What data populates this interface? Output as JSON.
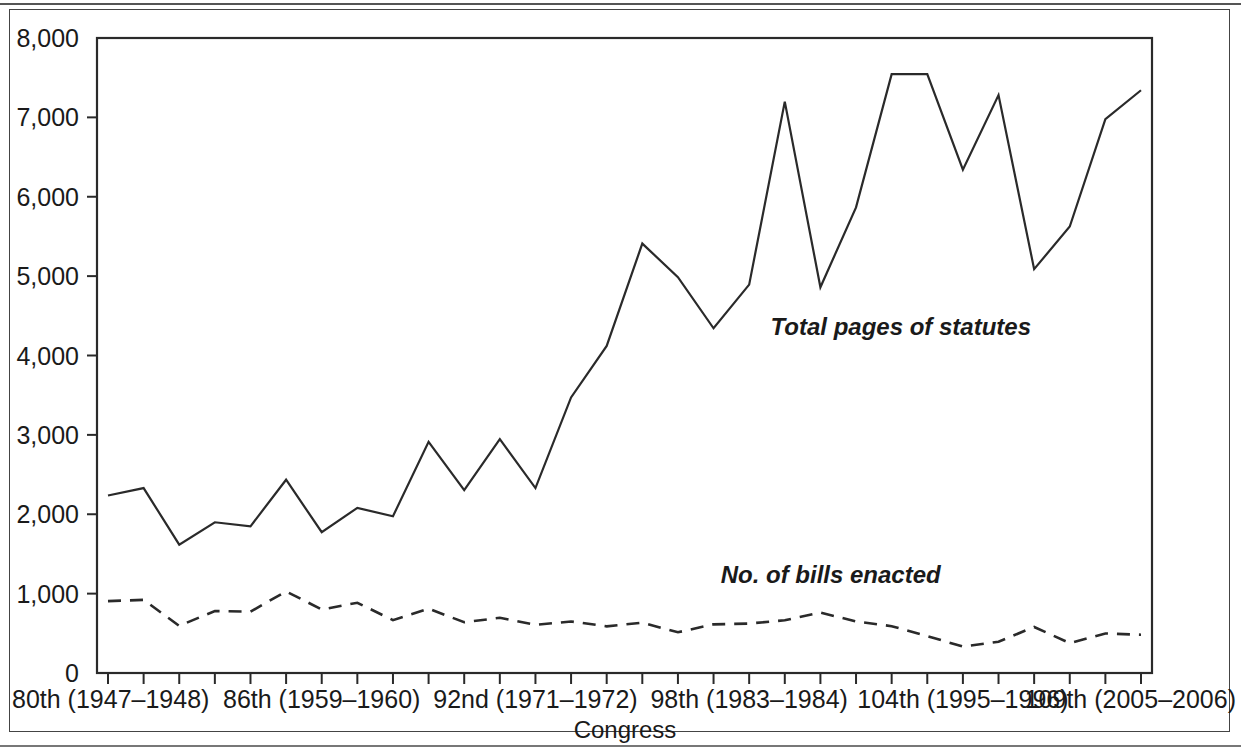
{
  "figure": {
    "partial_title_fragment": "",
    "frame_visible": true
  },
  "chart_data": {
    "type": "line",
    "title": "",
    "xlabel": "Congress",
    "ylabel": "",
    "ylim": [
      0,
      8000
    ],
    "ytick_values": [
      0,
      1000,
      2000,
      3000,
      4000,
      5000,
      6000,
      7000,
      8000
    ],
    "ytick_labels": [
      "0",
      "1,000",
      "2,000",
      "3,000",
      "4,000",
      "5,000",
      "6,000",
      "7,000",
      "8,000"
    ],
    "grid": false,
    "legend_position": "inline-annotations",
    "x": [
      80,
      81,
      82,
      83,
      84,
      85,
      86,
      87,
      88,
      89,
      90,
      91,
      92,
      93,
      94,
      95,
      96,
      97,
      98,
      99,
      100,
      101,
      102,
      103,
      104,
      105,
      106,
      107,
      108,
      109
    ],
    "xtick_labeled": [
      {
        "congress": 80,
        "label": "80th (1947–1948)"
      },
      {
        "congress": 86,
        "label": "86th (1959–1960)"
      },
      {
        "congress": 92,
        "label": "92nd (1971–1972)"
      },
      {
        "congress": 98,
        "label": "98th (1983–1984)"
      },
      {
        "congress": 104,
        "label": "104th (1995–1996)"
      },
      {
        "congress": 109,
        "label": "109th (2005–2006)"
      }
    ],
    "series": [
      {
        "name": "Total pages of statutes",
        "style": "solid",
        "annotation": "Total pages of statutes",
        "values": [
          2236,
          2330,
          1617,
          1899,
          1848,
          2435,
          1774,
          2080,
          1975,
          2912,
          2304,
          2947,
          2330,
          3472,
          4121,
          5410,
          4987,
          4343,
          4893,
          7198,
          4860,
          5866,
          7544,
          7544,
          6342,
          7281,
          5088,
          5625,
          6977,
          7342
        ]
      },
      {
        "name": "No. of bills enacted",
        "style": "dashed",
        "annotation": "No. of bills enacted",
        "values": [
          906,
          921,
          594,
          781,
          773,
          1028,
          800,
          885,
          666,
          810,
          640,
          695,
          607,
          649,
          588,
          634,
          513,
          613,
          623,
          664,
          761,
          650,
          590,
          465,
          333,
          394,
          580,
          377,
          498,
          482
        ]
      }
    ],
    "annotations": [
      {
        "text": "Total pages of statutes",
        "x_congress": 98.6,
        "y_value": 4260
      },
      {
        "text": "No. of bills enacted",
        "x_congress": 97.2,
        "y_value": 1140
      }
    ]
  }
}
